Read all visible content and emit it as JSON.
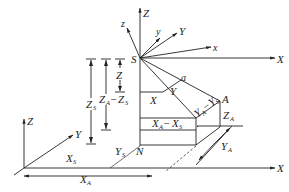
{
  "diagram": {
    "type": "coordinate-transformation",
    "points": {
      "S": "S",
      "N": "N",
      "A": "A",
      "a": "a"
    },
    "global_axes_origin": {
      "X": "X",
      "Y": "Y",
      "Z": "Z"
    },
    "station_global_axes": {
      "X": "X",
      "Y": "Y",
      "Z": "Z"
    },
    "station_local_axes": {
      "x": "x",
      "y": "y",
      "z": "z"
    },
    "projection_labels": {
      "X": "X",
      "Y": "Y",
      "Z": "Z"
    },
    "dimensions": {
      "Xs": {
        "main": "X",
        "sub": "S"
      },
      "XA": {
        "main": "X",
        "sub": "A"
      },
      "Ys": {
        "main": "Y",
        "sub": "S"
      },
      "YA": {
        "main": "Y",
        "sub": "A"
      },
      "Zs": {
        "main": "Z",
        "sub": "S"
      },
      "ZA": {
        "main": "Z",
        "sub": "A"
      },
      "XA_minus_Xs": {
        "a": "X",
        "a_sub": "A",
        "op": "−",
        "b": "X",
        "b_sub": "S"
      },
      "YA_minus_Ys": {
        "a": "Y",
        "a_sub": "A",
        "op": "−",
        "b": "Y",
        "b_sub": "S"
      },
      "ZA_minus_Zs": {
        "a": "Z",
        "a_sub": "A",
        "op": "−",
        "b": "Z",
        "b_sub": "S"
      }
    }
  }
}
